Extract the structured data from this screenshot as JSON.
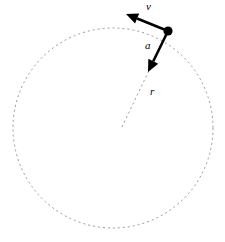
{
  "figure": {
    "background_color": "#ffffff",
    "width": 225,
    "height": 242
  },
  "circle": {
    "name": "circular-path",
    "center_x": 113,
    "center_y": 128,
    "radius": 100,
    "stroke_color": "#8c8c8c",
    "stroke_width": 0.9,
    "dash_pattern": "2,3",
    "fill": "none"
  },
  "particle": {
    "name": "particle-dot",
    "x": 168,
    "y": 31,
    "radius": 4.6,
    "color": "#000000"
  },
  "vectors": [
    {
      "id": "velocity",
      "label": "v",
      "label_x": 146,
      "label_y": 10,
      "x1": 168,
      "y1": 31,
      "x2": 126,
      "y2": 14,
      "color": "#000000",
      "stroke_width": 2.6,
      "description": "tangential velocity vector"
    },
    {
      "id": "acceleration",
      "label": "a",
      "label_x": 145,
      "label_y": 49,
      "x1": 168,
      "y1": 31,
      "x2": 148,
      "y2": 72,
      "color": "#000000",
      "stroke_width": 2.6,
      "description": "centripetal acceleration vector"
    }
  ],
  "radius_line": {
    "id": "radius",
    "label": "r",
    "label_x": 150,
    "label_y": 95,
    "x1": 166,
    "y1": 35,
    "x2": 121,
    "y2": 129,
    "color": "#8c8c8c",
    "stroke_width": 0.9,
    "dash_pattern": "2,3",
    "description": "dashed radius from center to particle"
  },
  "colors": {
    "ink": "#000000",
    "dashed_gray": "#8c8c8c",
    "background": "#ffffff"
  }
}
